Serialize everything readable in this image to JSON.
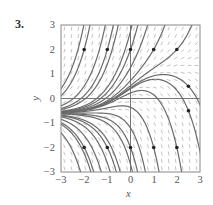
{
  "problem": {
    "number": "3."
  },
  "chart_data": {
    "type": "line",
    "subtype": "direction_field_with_solution_curves",
    "title": "",
    "xlabel": "x",
    "ylabel": "y",
    "xlim": [
      -3,
      3
    ],
    "ylim": [
      -3,
      3
    ],
    "xticks": [
      "−3",
      "−2",
      "−1",
      "0",
      "1",
      "2",
      "3"
    ],
    "yticks": [
      "3",
      "2",
      "1",
      "0",
      "−1",
      "−2",
      "−3"
    ],
    "xtick_values": [
      -3,
      -2,
      -1,
      0,
      1,
      2,
      3
    ],
    "ytick_values": [
      3,
      2,
      1,
      0,
      -1,
      -2,
      -3
    ],
    "grid": false,
    "axes_lines": {
      "x_axis_at_y": 0,
      "y_axis_at_x": 0
    },
    "marked_points": [
      [
        -2,
        2
      ],
      [
        -1,
        2
      ],
      [
        0,
        2
      ],
      [
        1,
        2
      ],
      [
        2,
        2
      ],
      [
        2.5,
        0.5
      ],
      [
        2.5,
        -0.5
      ],
      [
        -2,
        -2
      ],
      [
        -1,
        -2
      ],
      [
        0,
        -2
      ],
      [
        1,
        -2
      ],
      [
        2,
        -2
      ]
    ],
    "separatrix_approx": {
      "x": [
        -3,
        -2,
        -1,
        -0.7,
        0,
        1,
        2,
        3
      ],
      "y": [
        -0.57,
        -0.5,
        -0.16,
        0.0,
        0.47,
        0.93,
        1.23,
        1.37
      ]
    },
    "solution_curves_initial_points": [
      [
        -2,
        2
      ],
      [
        -1,
        2
      ],
      [
        0,
        2
      ],
      [
        1,
        2
      ],
      [
        2,
        2
      ],
      [
        2.5,
        0.5
      ],
      [
        2.5,
        -0.5
      ],
      [
        -2,
        -2
      ],
      [
        -1,
        -2
      ],
      [
        0,
        -2
      ],
      [
        1,
        -2
      ],
      [
        2,
        -2
      ],
      [
        -3,
        0.4
      ],
      [
        -3,
        -0.3
      ],
      [
        -3,
        -0.45
      ],
      [
        -3,
        -0.52
      ],
      [
        -3,
        -0.55
      ],
      [
        -3,
        -0.6
      ],
      [
        -3,
        -0.63
      ],
      [
        -3,
        -0.68
      ],
      [
        -3,
        -0.75
      ],
      [
        -3,
        -0.85
      ],
      [
        -3,
        -1.05
      ],
      [
        -3,
        -1.4
      ]
    ],
    "colors": {
      "curve": "#6b6b6b",
      "field": "#b5b5b5",
      "axes": "#777777",
      "frame": "#888888",
      "point": "#222222"
    }
  }
}
